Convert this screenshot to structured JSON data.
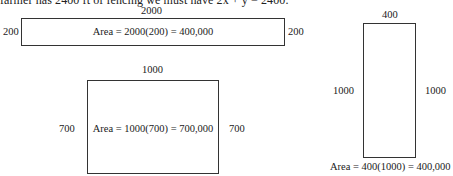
{
  "top_text": "farmer has 2400 ft of fencing we must have 2x + y = 2400.",
  "diagrams": [
    {
      "name": "rectangle-1",
      "top_label": "2000",
      "left_label": "200",
      "right_label": "200",
      "area_text": "Area = 2000(200) = 400,000"
    },
    {
      "name": "rectangle-2",
      "top_label": "1000",
      "left_label": "700",
      "right_label": "700",
      "area_text": "Area = 1000(700) = 700,000"
    },
    {
      "name": "rectangle-3",
      "top_label": "400",
      "left_label": "1000",
      "right_label": "1000",
      "area_text": "Area = 400(1000) = 400,000"
    }
  ]
}
